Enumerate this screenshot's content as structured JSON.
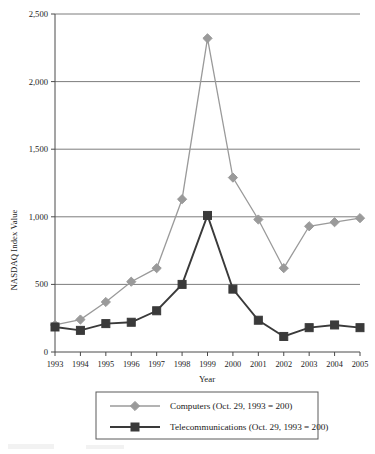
{
  "chart_data": {
    "type": "line",
    "title": "",
    "xlabel": "Year",
    "ylabel": "NASDAQ Index Value",
    "categories": [
      "1993",
      "1994",
      "1995",
      "1996",
      "1997",
      "1998",
      "1999",
      "2000",
      "2001",
      "2002",
      "2003",
      "2004",
      "2005"
    ],
    "ylim": [
      0,
      2500
    ],
    "yticks": [
      0,
      500,
      1000,
      1500,
      2000,
      2500
    ],
    "ytick_labels": [
      "0",
      "500",
      "1,000",
      "1,500",
      "2,000",
      "2,500"
    ],
    "grid": true,
    "legend_position": "bottom",
    "series": [
      {
        "name": "Computers (Oct. 29, 1993 = 200)",
        "short_name": "Computers",
        "color": "#9a9a9a",
        "marker": "diamond",
        "values": [
          200,
          240,
          370,
          520,
          620,
          1130,
          2320,
          1290,
          980,
          620,
          930,
          960,
          990
        ]
      },
      {
        "name": "Telecommunications (Oct. 29, 1993 = 200)",
        "short_name": "Telecommunications",
        "color": "#3a3a3a",
        "marker": "square",
        "values": [
          185,
          160,
          210,
          220,
          305,
          500,
          1010,
          465,
          235,
          115,
          180,
          200,
          180
        ]
      }
    ]
  },
  "axes": {
    "y_title": "NASDAQ Index Value",
    "x_title": "Year"
  },
  "legend": {
    "items": [
      {
        "label": "Computers (Oct. 29, 1993 = 200)"
      },
      {
        "label": "Telecommunications (Oct. 29, 1993 = 200)"
      }
    ]
  },
  "colors": {
    "series_computers": "#9a9a9a",
    "series_telecom": "#3a3a3a",
    "grid": "#6e6e6e",
    "axis": "#4a4a4a",
    "text": "#1b1b1b",
    "background": "#ffffff"
  }
}
